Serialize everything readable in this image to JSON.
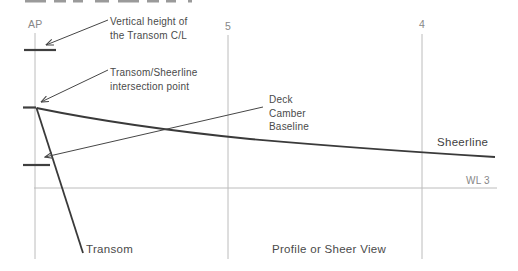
{
  "diagram": {
    "view_title": "Profile or Sheer View",
    "colors": {
      "background": "#ffffff",
      "dark_line": "#3f3f3f",
      "grid_line": "#bcbcbc",
      "dark_text": "#4a4a4a",
      "light_text": "#878787"
    },
    "stations": {
      "ap": "AP",
      "s5": "5",
      "s4": "4"
    },
    "waterline_label": "WL 3",
    "curve_labels": {
      "sheerline": "Sheerline",
      "transom": "Transom"
    },
    "annotations": {
      "transom_height": {
        "line1": "Vertical height of",
        "line2": "the Transom C/L"
      },
      "intersection": {
        "line1": "Transom/Sheerline",
        "line2": "intersection point"
      },
      "deck_camber": {
        "line1": "Deck",
        "line2": "Camber",
        "line3": "Baseline"
      }
    }
  }
}
